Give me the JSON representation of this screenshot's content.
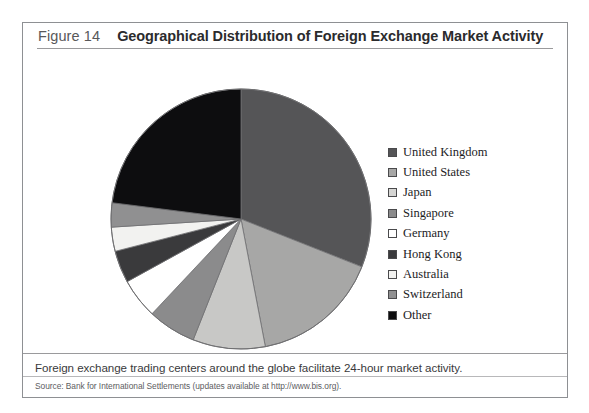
{
  "figure": {
    "number": "Figure 14",
    "title": "Geographical Distribution of Foreign Exchange Market Activity",
    "caption": "Foreign exchange trading centers around the globe facilitate 24-hour market activity.",
    "source": "Source: Bank for International Settlements (updates available at http://www.bis.org)."
  },
  "chart_data": {
    "type": "pie",
    "title": "Geographical Distribution of Foreign Exchange Market Activity",
    "xlabel": "",
    "ylabel": "",
    "legend_position": "right",
    "start_angle_deg": 0,
    "direction": "clockwise",
    "categories": [
      "United Kingdom",
      "United States",
      "Japan",
      "Singapore",
      "Germany",
      "Hong Kong",
      "Australia",
      "Switzerland",
      "Other"
    ],
    "values": [
      31,
      16,
      9,
      6,
      5,
      4,
      3,
      3,
      23
    ],
    "unit": "percent of global turnover",
    "slices": [
      {
        "label": "United Kingdom",
        "value": 31,
        "color": "#555557"
      },
      {
        "label": "United States",
        "value": 16,
        "color": "#a7a7a6"
      },
      {
        "label": "Japan",
        "value": 9,
        "color": "#c8c8c6"
      },
      {
        "label": "Singapore",
        "value": 6,
        "color": "#8b8b8c"
      },
      {
        "label": "Germany",
        "value": 5,
        "color": "#ffffff"
      },
      {
        "label": "Hong Kong",
        "value": 4,
        "color": "#3a3a3c"
      },
      {
        "label": "Australia",
        "value": 3,
        "color": "#f2f2f0"
      },
      {
        "label": "Switzerland",
        "value": 3,
        "color": "#909091"
      },
      {
        "label": "Other",
        "value": 23,
        "color": "#0d0d0f"
      }
    ]
  },
  "legend": {
    "items": [
      {
        "label": "United Kingdom",
        "color": "#555557"
      },
      {
        "label": "United States",
        "color": "#a7a7a6"
      },
      {
        "label": "Japan",
        "color": "#d5d5d3"
      },
      {
        "label": "Singapore",
        "color": "#8b8b8c"
      },
      {
        "label": "Germany",
        "color": "#ffffff"
      },
      {
        "label": "Hong Kong",
        "color": "#3a3a3c"
      },
      {
        "label": "Australia",
        "color": "#f2f2f0"
      },
      {
        "label": "Switzerland",
        "color": "#909091"
      },
      {
        "label": "Other",
        "color": "#0d0d0f"
      }
    ]
  }
}
